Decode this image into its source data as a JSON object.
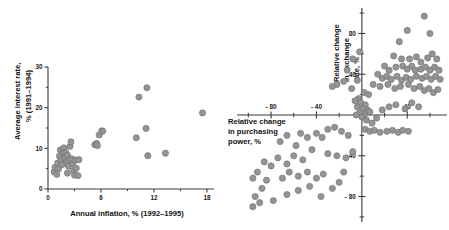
{
  "figure": {
    "title": "",
    "background": "#ffffff",
    "marker_color": "#949494",
    "marker_edge_color": "#6f6f6f",
    "axis_color": "#3a3a3a",
    "text_color": "#1a1a1a"
  },
  "panels": {
    "left": {
      "name": "inflation-vs-interest-rate-scatter",
      "xlabel": "Annual inflation, % (1992–1995)",
      "ylabel_line1": "Average interest rate,",
      "ylabel_line2": "% (1991–1994)",
      "xticks": [
        "0",
        "6",
        "12",
        "18"
      ],
      "yticks": [
        "0",
        "10",
        "20",
        "30"
      ]
    },
    "right": {
      "name": "purchasing-power-vs-exchange-rate-scatter",
      "xlabel_line1": "Relative change",
      "xlabel_line2": "in purchasing",
      "xlabel_line3": "power, %",
      "ylabel_line1": "Relative change",
      "ylabel_line2": "in exchange",
      "ylabel_line3": "rate, %",
      "xticks": [
        "- 80",
        "- 40",
        "40"
      ],
      "yticks": [
        "80",
        "40",
        "- 40",
        "- 80"
      ]
    }
  },
  "chart_data": [
    {
      "type": "scatter",
      "id": "left",
      "title": "",
      "xlabel": "Annual inflation, % (1992–1995)",
      "ylabel": "Average interest rate, % (1991–1994)",
      "xlim": [
        0,
        18.8
      ],
      "ylim": [
        0,
        30
      ],
      "xticks": [
        0,
        6,
        12,
        18
      ],
      "yticks": [
        0,
        10,
        20,
        30
      ],
      "xminorticks": [
        3,
        9,
        15
      ],
      "yminorticks": [
        5,
        15,
        25
      ],
      "grid": false,
      "legend": null,
      "points": [
        [
          0.7,
          4.2
        ],
        [
          0.8,
          5.3
        ],
        [
          1.0,
          3.6
        ],
        [
          1.1,
          6.4
        ],
        [
          1.2,
          5.0
        ],
        [
          1.3,
          8.1
        ],
        [
          1.4,
          9.6
        ],
        [
          1.5,
          7.0
        ],
        [
          1.6,
          6.0
        ],
        [
          1.7,
          8.8
        ],
        [
          1.8,
          10.1
        ],
        [
          1.9,
          7.6
        ],
        [
          2.0,
          9.0
        ],
        [
          2.1,
          6.7
        ],
        [
          2.2,
          8.3
        ],
        [
          2.3,
          5.6
        ],
        [
          2.4,
          7.2
        ],
        [
          2.5,
          10.5
        ],
        [
          2.6,
          11.6
        ],
        [
          2.7,
          7.4
        ],
        [
          2.8,
          6.2
        ],
        [
          2.9,
          4.6
        ],
        [
          3.0,
          3.4
        ],
        [
          3.1,
          7.1
        ],
        [
          3.2,
          5.1
        ],
        [
          3.4,
          3.3
        ],
        [
          3.5,
          7.2
        ],
        [
          2.2,
          3.9
        ],
        [
          5.3,
          10.9
        ],
        [
          5.5,
          11.2
        ],
        [
          5.6,
          10.7
        ],
        [
          6.1,
          14.3
        ],
        [
          6.2,
          14.2
        ],
        [
          5.8,
          13.3
        ],
        [
          10.0,
          12.6
        ],
        [
          10.3,
          22.6
        ],
        [
          11.1,
          14.9
        ],
        [
          11.2,
          24.9
        ],
        [
          11.3,
          8.2
        ],
        [
          13.3,
          8.8
        ],
        [
          17.5,
          18.7
        ]
      ]
    },
    {
      "type": "scatter",
      "id": "right",
      "title": "",
      "xlabel": "Relative change in purchasing power, %",
      "ylabel": "Relative change in exchange rate, %",
      "xlim": [
        -110,
        75
      ],
      "ylim": [
        -105,
        105
      ],
      "xticks": [
        -80,
        -40,
        40
      ],
      "yticks": [
        80,
        40,
        -40,
        -80
      ],
      "xminorticks": [
        -100,
        -60,
        -20,
        20,
        60
      ],
      "yminorticks": [
        100,
        60,
        20,
        -20,
        -60,
        -100
      ],
      "grid": false,
      "legend": null,
      "points": [
        [
          55,
          97
        ],
        [
          40,
          83
        ],
        [
          60,
          80
        ],
        [
          33,
          72
        ],
        [
          28,
          58
        ],
        [
          35,
          55
        ],
        [
          42,
          55
        ],
        [
          48,
          57
        ],
        [
          52,
          52
        ],
        [
          58,
          56
        ],
        [
          62,
          60
        ],
        [
          66,
          55
        ],
        [
          20,
          48
        ],
        [
          24,
          44
        ],
        [
          30,
          47
        ],
        [
          36,
          48
        ],
        [
          40,
          45
        ],
        [
          44,
          48
        ],
        [
          47,
          44
        ],
        [
          52,
          45
        ],
        [
          56,
          47
        ],
        [
          60,
          44
        ],
        [
          64,
          47
        ],
        [
          68,
          44
        ],
        [
          14,
          40
        ],
        [
          18,
          36
        ],
        [
          22,
          38
        ],
        [
          26,
          35
        ],
        [
          31,
          38
        ],
        [
          35,
          34
        ],
        [
          39,
          37
        ],
        [
          43,
          35
        ],
        [
          48,
          38
        ],
        [
          53,
          36
        ],
        [
          57,
          38
        ],
        [
          61,
          35
        ],
        [
          65,
          38
        ],
        [
          69,
          35
        ],
        [
          10,
          30
        ],
        [
          16,
          28
        ],
        [
          23,
          30
        ],
        [
          29,
          26
        ],
        [
          34,
          28
        ],
        [
          41,
          30
        ],
        [
          46,
          26
        ],
        [
          51,
          28
        ],
        [
          55,
          24
        ],
        [
          59,
          26
        ],
        [
          63,
          22
        ],
        [
          67,
          25
        ],
        [
          -2,
          62
        ],
        [
          -8,
          55
        ],
        [
          -13,
          44
        ],
        [
          -16,
          33
        ],
        [
          -22,
          30
        ],
        [
          -26,
          28
        ],
        [
          -4,
          34
        ],
        [
          -9,
          26
        ],
        [
          2,
          22
        ],
        [
          6,
          20
        ],
        [
          -3,
          16
        ],
        [
          -6,
          14
        ],
        [
          -1,
          12
        ],
        [
          3,
          10
        ],
        [
          -4,
          8
        ],
        [
          1,
          6
        ],
        [
          5,
          5
        ],
        [
          -2,
          2
        ],
        [
          2,
          0
        ],
        [
          7,
          3
        ],
        [
          -5,
          0
        ],
        [
          0,
          -2
        ],
        [
          4,
          -5
        ],
        [
          9,
          -8
        ],
        [
          13,
          -3
        ],
        [
          18,
          5
        ],
        [
          24,
          8
        ],
        [
          30,
          10
        ],
        [
          38,
          6
        ],
        [
          44,
          12
        ],
        [
          50,
          8
        ],
        [
          3,
          -14
        ],
        [
          7,
          -16
        ],
        [
          11,
          -15
        ],
        [
          16,
          -17
        ],
        [
          22,
          -16
        ],
        [
          27,
          -15
        ],
        [
          32,
          -17
        ],
        [
          36,
          -15
        ],
        [
          41,
          -16
        ],
        [
          -12,
          -20
        ],
        [
          -18,
          -16
        ],
        [
          -24,
          -12
        ],
        [
          -30,
          -14
        ],
        [
          -35,
          -22
        ],
        [
          -40,
          -18
        ],
        [
          -48,
          -22
        ],
        [
          -54,
          -18
        ],
        [
          -58,
          -30
        ],
        [
          -66,
          -20
        ],
        [
          -72,
          -26
        ],
        [
          -8,
          -36
        ],
        [
          -14,
          -42
        ],
        [
          -22,
          -40
        ],
        [
          -30,
          -38
        ],
        [
          -44,
          -34
        ],
        [
          -52,
          -44
        ],
        [
          -60,
          -40
        ],
        [
          -66,
          -48
        ],
        [
          -74,
          -42
        ],
        [
          -80,
          -50
        ],
        [
          -86,
          -46
        ],
        [
          -92,
          -56
        ],
        [
          -96,
          -62
        ],
        [
          -84,
          -64
        ],
        [
          -88,
          -72
        ],
        [
          -94,
          -80
        ],
        [
          -90,
          -86
        ],
        [
          -96,
          -90
        ],
        [
          -78,
          -84
        ],
        [
          -70,
          -62
        ],
        [
          -64,
          -56
        ],
        [
          -56,
          -60
        ],
        [
          -48,
          -56
        ],
        [
          -40,
          -62
        ],
        [
          -34,
          -58
        ],
        [
          -46,
          -70
        ],
        [
          -56,
          -74
        ],
        [
          -66,
          -78
        ],
        [
          -36,
          -80
        ],
        [
          -26,
          -72
        ],
        [
          -20,
          -66
        ],
        [
          -16,
          -56
        ]
      ]
    }
  ]
}
